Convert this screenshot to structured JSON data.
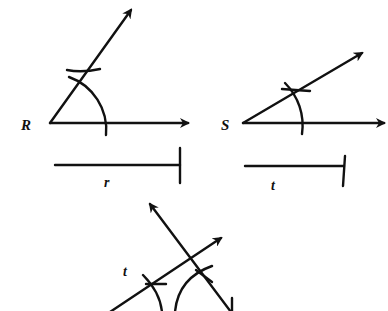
{
  "diagram": {
    "type": "geometric-construction",
    "colors": {
      "ink": "#111111",
      "background": "#ffffff"
    },
    "figures": [
      {
        "id": "angle-R",
        "vertex_label": "R",
        "segment_label": "r"
      },
      {
        "id": "angle-S",
        "vertex_label": "S",
        "segment_label": "t"
      },
      {
        "id": "construction",
        "labels": [
          "t"
        ]
      }
    ]
  },
  "labels": {
    "R": "R",
    "r": "r",
    "S": "S",
    "t_segment": "t",
    "t_construction": "t"
  }
}
